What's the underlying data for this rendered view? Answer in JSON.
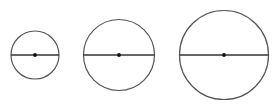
{
  "diagram": {
    "width": 275,
    "height": 109,
    "background": "#ffffff",
    "stroke_color": "#555555",
    "diameter_color": "#333333",
    "center_color": "#111111",
    "circles": [
      {
        "id": "small",
        "cx": 35,
        "cy": 55,
        "r": 24
      },
      {
        "id": "medium",
        "cx": 119,
        "cy": 55,
        "r": 35.5
      },
      {
        "id": "large",
        "cx": 224,
        "cy": 55,
        "r": 44.5
      }
    ]
  }
}
